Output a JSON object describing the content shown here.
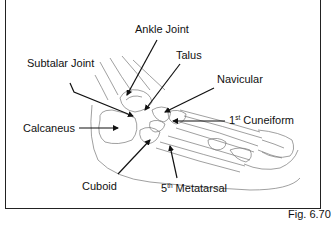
{
  "figure": {
    "caption": "Fig. 6.70"
  },
  "labels": {
    "ankle_joint": "Ankle Joint",
    "subtalar_joint": "Subtalar Joint",
    "talus": "Talus",
    "navicular": "Navicular",
    "calcaneus": "Calcaneus",
    "first_cuneiform_num": "1",
    "first_cuneiform_sup": "st",
    "first_cuneiform_text": " Cuneiform",
    "cuboid": "Cuboid",
    "fifth_metatarsal_num": "5",
    "fifth_metatarsal_sup": "th",
    "fifth_metatarsal_text": " Metatarsal"
  },
  "colors": {
    "line": "#111111",
    "sketch": "#777777",
    "background": "#ffffff"
  }
}
